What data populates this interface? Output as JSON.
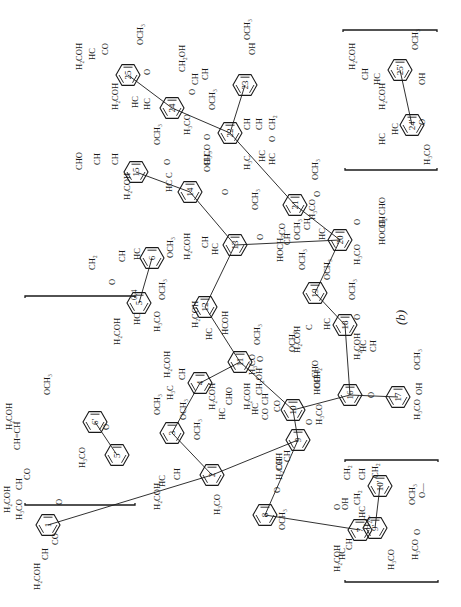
{
  "figure": {
    "caption": "(b)",
    "subscript_note": "0.4",
    "rings": [
      {
        "id": "1",
        "x": 48,
        "y": 525
      },
      {
        "id": "2",
        "x": 212,
        "y": 475
      },
      {
        "id": "3",
        "x": 172,
        "y": 433
      },
      {
        "id": "4",
        "x": 200,
        "y": 383
      },
      {
        "id": "5",
        "x": 139,
        "y": 303
      },
      {
        "id": "6",
        "x": 152,
        "y": 258
      },
      {
        "id": "7",
        "x": 360,
        "y": 530
      },
      {
        "id": "8",
        "x": 265,
        "y": 515
      },
      {
        "id": "9",
        "x": 298,
        "y": 440
      },
      {
        "id": "10",
        "x": 293,
        "y": 410
      },
      {
        "id": "11",
        "x": 240,
        "y": 362
      },
      {
        "id": "12",
        "x": 205,
        "y": 307
      },
      {
        "id": "13",
        "x": 235,
        "y": 245
      },
      {
        "id": "14",
        "x": 190,
        "y": 192
      },
      {
        "id": "15",
        "x": 136,
        "y": 172
      },
      {
        "id": "16",
        "x": 350,
        "y": 395
      },
      {
        "id": "17",
        "x": 398,
        "y": 397
      },
      {
        "id": "18",
        "x": 345,
        "y": 325
      },
      {
        "id": "19",
        "x": 315,
        "y": 293
      },
      {
        "id": "20",
        "x": 340,
        "y": 240
      },
      {
        "id": "21",
        "x": 295,
        "y": 205
      },
      {
        "id": "22",
        "x": 230,
        "y": 133
      },
      {
        "id": "23",
        "x": 245,
        "y": 85
      },
      {
        "id": "24",
        "x": 172,
        "y": 108
      },
      {
        "id": "25",
        "x": 128,
        "y": 75
      },
      {
        "id": "5'",
        "x": 117,
        "y": 455
      },
      {
        "id": "6'",
        "x": 95,
        "y": 422
      },
      {
        "id": "9'",
        "x": 375,
        "y": 528
      },
      {
        "id": "10'",
        "x": 380,
        "y": 486
      },
      {
        "id": "24'",
        "x": 412,
        "y": 125
      },
      {
        "id": "25'",
        "x": 400,
        "y": 70
      }
    ],
    "labels": [
      {
        "t": "H₂COH",
        "x": 40,
        "y": 590
      },
      {
        "t": "CH",
        "x": 48,
        "y": 560
      },
      {
        "t": "CO",
        "x": 58,
        "y": 545
      },
      {
        "t": "H₃CO",
        "x": 22,
        "y": 520
      },
      {
        "t": "O",
        "x": 62,
        "y": 505
      },
      {
        "t": "H₂COH",
        "x": 10,
        "y": 513
      },
      {
        "t": "CH",
        "x": 22,
        "y": 490
      },
      {
        "t": "CO",
        "x": 30,
        "y": 480
      },
      {
        "t": "H₃CO",
        "x": 85,
        "y": 468
      },
      {
        "t": "O",
        "x": 109,
        "y": 430
      },
      {
        "t": "H₂COH",
        "x": 12,
        "y": 430
      },
      {
        "t": "CH=CH",
        "x": 20,
        "y": 450
      },
      {
        "t": "OCH₃",
        "x": 50,
        "y": 395
      },
      {
        "t": "H₂COH",
        "x": 160,
        "y": 510
      },
      {
        "t": "HC",
        "x": 165,
        "y": 487
      },
      {
        "t": "CH",
        "x": 180,
        "y": 480
      },
      {
        "t": "H₃CO",
        "x": 220,
        "y": 515
      },
      {
        "t": "OCH₃",
        "x": 200,
        "y": 440
      },
      {
        "t": "OCH₃",
        "x": 160,
        "y": 415
      },
      {
        "t": "OCH₃",
        "x": 186,
        "y": 420
      },
      {
        "t": "H₃C",
        "x": 173,
        "y": 400
      },
      {
        "t": "CH",
        "x": 185,
        "y": 380
      },
      {
        "t": "H₂COH",
        "x": 170,
        "y": 378
      },
      {
        "t": "H₂COH",
        "x": 120,
        "y": 345
      },
      {
        "t": "HC",
        "x": 140,
        "y": 325
      },
      {
        "t": "O",
        "x": 115,
        "y": 285
      },
      {
        "t": "CH₂",
        "x": 95,
        "y": 270
      },
      {
        "t": "CH",
        "x": 125,
        "y": 262
      },
      {
        "t": "HC",
        "x": 140,
        "y": 260
      },
      {
        "t": "H₃CO",
        "x": 160,
        "y": 332
      },
      {
        "t": "OCH₃",
        "x": 165,
        "y": 300
      },
      {
        "t": "OCH₃",
        "x": 173,
        "y": 258
      },
      {
        "t": "H₂COH",
        "x": 198,
        "y": 328
      },
      {
        "t": "HC",
        "x": 212,
        "y": 340
      },
      {
        "t": "HCOH",
        "x": 228,
        "y": 335
      },
      {
        "t": "H₃CO",
        "x": 255,
        "y": 375
      },
      {
        "t": "OCH₃",
        "x": 260,
        "y": 345
      },
      {
        "t": "O",
        "x": 263,
        "y": 362
      },
      {
        "t": "H₂COH",
        "x": 215,
        "y": 410
      },
      {
        "t": "HC",
        "x": 225,
        "y": 420
      },
      {
        "t": "CHO",
        "x": 232,
        "y": 405
      },
      {
        "t": "H₂COH",
        "x": 250,
        "y": 410
      },
      {
        "t": "HC",
        "x": 258,
        "y": 415
      },
      {
        "t": "CO",
        "x": 268,
        "y": 420
      },
      {
        "t": "H₃CO",
        "x": 322,
        "y": 425
      },
      {
        "t": "O",
        "x": 312,
        "y": 425
      },
      {
        "t": "HOCH₂",
        "x": 320,
        "y": 395
      },
      {
        "t": "CH",
        "x": 320,
        "y": 388
      },
      {
        "t": "CHO",
        "x": 318,
        "y": 378
      },
      {
        "t": "H₂COH",
        "x": 282,
        "y": 480
      },
      {
        "t": "CH",
        "x": 282,
        "y": 470
      },
      {
        "t": "CH",
        "x": 290,
        "y": 462
      },
      {
        "t": "O",
        "x": 280,
        "y": 493
      },
      {
        "t": "OCH₃",
        "x": 285,
        "y": 530
      },
      {
        "t": "H₂COH",
        "x": 340,
        "y": 572
      },
      {
        "t": "HC",
        "x": 345,
        "y": 560
      },
      {
        "t": "CH",
        "x": 352,
        "y": 550
      },
      {
        "t": "OH",
        "x": 348,
        "y": 510
      },
      {
        "t": "H₃CO",
        "x": 394,
        "y": 570
      },
      {
        "t": "OCH₃",
        "x": 295,
        "y": 352
      },
      {
        "t": "CH₂OH",
        "x": 262,
        "y": 395
      },
      {
        "t": "CH",
        "x": 268,
        "y": 405
      },
      {
        "t": "CO",
        "x": 280,
        "y": 412
      },
      {
        "t": "O",
        "x": 374,
        "y": 398
      },
      {
        "t": "H₂COH",
        "x": 360,
        "y": 360
      },
      {
        "t": "HC",
        "x": 366,
        "y": 352
      },
      {
        "t": "CH",
        "x": 376,
        "y": 352
      },
      {
        "t": "H₃CO",
        "x": 420,
        "y": 420
      },
      {
        "t": "OH",
        "x": 422,
        "y": 395
      },
      {
        "t": "OCH₃",
        "x": 420,
        "y": 370
      },
      {
        "t": "H₂COH",
        "x": 300,
        "y": 353
      },
      {
        "t": "C",
        "x": 312,
        "y": 330
      },
      {
        "t": "HC",
        "x": 330,
        "y": 330
      },
      {
        "t": "O",
        "x": 360,
        "y": 320
      },
      {
        "t": "OCH₃",
        "x": 355,
        "y": 300
      },
      {
        "t": "OCH₃",
        "x": 305,
        "y": 270
      },
      {
        "t": "OCH₃",
        "x": 330,
        "y": 280
      },
      {
        "t": "HOCH₂",
        "x": 283,
        "y": 262
      },
      {
        "t": "CH",
        "x": 290,
        "y": 245
      },
      {
        "t": "CO",
        "x": 285,
        "y": 235
      },
      {
        "t": "OCH₃",
        "x": 300,
        "y": 240
      },
      {
        "t": "CH",
        "x": 310,
        "y": 230
      },
      {
        "t": "HC",
        "x": 325,
        "y": 240
      },
      {
        "t": "H₃CO",
        "x": 360,
        "y": 265
      },
      {
        "t": "O",
        "x": 360,
        "y": 225
      },
      {
        "t": "HOCH₂",
        "x": 385,
        "y": 245
      },
      {
        "t": "CH",
        "x": 385,
        "y": 228
      },
      {
        "t": "CHO",
        "x": 385,
        "y": 215
      },
      {
        "t": "H₂COH",
        "x": 190,
        "y": 260
      },
      {
        "t": "CH",
        "x": 208,
        "y": 248
      },
      {
        "t": "HC",
        "x": 218,
        "y": 255
      },
      {
        "t": "O",
        "x": 263,
        "y": 240
      },
      {
        "t": "OCH₃",
        "x": 258,
        "y": 210
      },
      {
        "t": "O",
        "x": 228,
        "y": 195
      },
      {
        "t": "OCH₃",
        "x": 210,
        "y": 172
      },
      {
        "t": "HC",
        "x": 172,
        "y": 192
      },
      {
        "t": "C",
        "x": 172,
        "y": 178
      },
      {
        "t": "O",
        "x": 170,
        "y": 165
      },
      {
        "t": "H₂COH",
        "x": 130,
        "y": 200
      },
      {
        "t": "CHO",
        "x": 82,
        "y": 170
      },
      {
        "t": "CH",
        "x": 100,
        "y": 165
      },
      {
        "t": "CH",
        "x": 118,
        "y": 165
      },
      {
        "t": "OCH₃",
        "x": 160,
        "y": 145
      },
      {
        "t": "H₂COH",
        "x": 118,
        "y": 110
      },
      {
        "t": "HC",
        "x": 138,
        "y": 108
      },
      {
        "t": "HC",
        "x": 150,
        "y": 110
      },
      {
        "t": "H₃CO",
        "x": 190,
        "y": 135
      },
      {
        "t": "O",
        "x": 195,
        "y": 95
      },
      {
        "t": "CH",
        "x": 198,
        "y": 85
      },
      {
        "t": "CH₂OH",
        "x": 185,
        "y": 72
      },
      {
        "t": "CH",
        "x": 208,
        "y": 80
      },
      {
        "t": "OH",
        "x": 255,
        "y": 55
      },
      {
        "t": "OCH₃",
        "x": 250,
        "y": 40
      },
      {
        "t": "H₂COH",
        "x": 82,
        "y": 70
      },
      {
        "t": "HC",
        "x": 95,
        "y": 60
      },
      {
        "t": "CO",
        "x": 108,
        "y": 55
      },
      {
        "t": "O",
        "x": 150,
        "y": 75
      },
      {
        "t": "OCH₃",
        "x": 143,
        "y": 45
      },
      {
        "t": "H₃CO",
        "x": 210,
        "y": 165
      },
      {
        "t": "OCH₃",
        "x": 215,
        "y": 110
      },
      {
        "t": "O",
        "x": 210,
        "y": 140
      },
      {
        "t": "H₃C",
        "x": 250,
        "y": 170
      },
      {
        "t": "HC",
        "x": 265,
        "y": 162
      },
      {
        "t": "HC",
        "x": 275,
        "y": 165
      },
      {
        "t": "CH",
        "x": 250,
        "y": 130
      },
      {
        "t": "CH",
        "x": 262,
        "y": 130
      },
      {
        "t": "CH₂",
        "x": 275,
        "y": 130
      },
      {
        "t": "O",
        "x": 275,
        "y": 142
      },
      {
        "t": "H₃CO",
        "x": 315,
        "y": 220
      },
      {
        "t": "OCH₃",
        "x": 318,
        "y": 180
      },
      {
        "t": "O",
        "x": 320,
        "y": 197
      },
      {
        "t": "H₂COH",
        "x": 385,
        "y": 110
      },
      {
        "t": "HC",
        "x": 398,
        "y": 135
      },
      {
        "t": "HC",
        "x": 385,
        "y": 145
      },
      {
        "t": "H₃CO",
        "x": 430,
        "y": 165
      },
      {
        "t": "O",
        "x": 425,
        "y": 125
      },
      {
        "t": "H₂COH",
        "x": 355,
        "y": 70
      },
      {
        "t": "CH",
        "x": 368,
        "y": 80
      },
      {
        "t": "HC",
        "x": 380,
        "y": 85
      },
      {
        "t": "OH",
        "x": 425,
        "y": 85
      },
      {
        "t": "OCH₃",
        "x": 418,
        "y": 50
      },
      {
        "t": "H₂C",
        "x": 370,
        "y": 530
      },
      {
        "t": "HC",
        "x": 365,
        "y": 518
      },
      {
        "t": "CH₂",
        "x": 360,
        "y": 505
      },
      {
        "t": "O",
        "x": 340,
        "y": 510
      },
      {
        "t": "CH₂",
        "x": 350,
        "y": 480
      },
      {
        "t": "CH",
        "x": 365,
        "y": 480
      },
      {
        "t": "CH₂",
        "x": 378,
        "y": 478
      },
      {
        "t": "O—",
        "x": 425,
        "y": 498
      },
      {
        "t": "OCH₃",
        "x": 415,
        "y": 505
      },
      {
        "t": "O",
        "x": 420,
        "y": 535
      },
      {
        "t": "H₃CO",
        "x": 418,
        "y": 560
      }
    ],
    "brackets": [
      {
        "x": 25,
        "y1": 395,
        "y2": 500,
        "side": "left",
        "note": "0.4"
      },
      {
        "x": 345,
        "y1": 460,
        "y2": 582,
        "side": "bottom-right"
      },
      {
        "x": 345,
        "y1": 30,
        "y2": 175,
        "side": "top-right"
      }
    ]
  }
}
